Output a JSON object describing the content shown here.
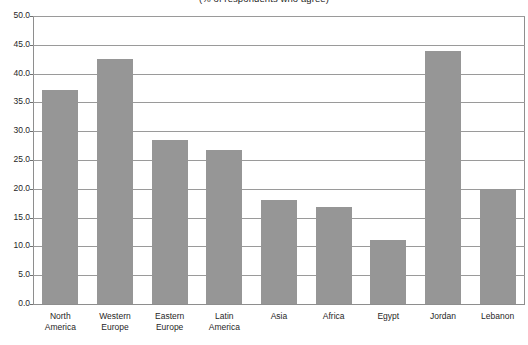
{
  "chart_data": {
    "type": "bar",
    "title": "(% of respondents who agree)",
    "xlabel": "",
    "ylabel": "",
    "categories": [
      "North America",
      "Western Europe",
      "Eastern Europe",
      "Latin America",
      "Asia",
      "Africa",
      "Egypt",
      "Jordan",
      "Lebanon"
    ],
    "category_lines": [
      [
        "North",
        "America"
      ],
      [
        "Western",
        "Europe"
      ],
      [
        "Eastern",
        "Europe"
      ],
      [
        "Latin",
        "America"
      ],
      [
        "Asia"
      ],
      [
        "Africa"
      ],
      [
        "Egypt"
      ],
      [
        "Jordan"
      ],
      [
        "Lebanon"
      ]
    ],
    "values": [
      37.2,
      42.5,
      28.5,
      26.7,
      18.0,
      16.8,
      11.2,
      44.0,
      20.0
    ],
    "ylim": [
      0.0,
      50.0
    ],
    "ytick_values": [
      0.0,
      5.0,
      10.0,
      15.0,
      20.0,
      25.0,
      30.0,
      35.0,
      40.0,
      45.0,
      50.0
    ],
    "ytick_labels": [
      "0.0",
      "5.0",
      "10.0",
      "15.0",
      "20.0",
      "25.0",
      "30.0",
      "35.0",
      "40.0",
      "45.0",
      "50.0"
    ],
    "grid": true,
    "legend": null,
    "bar_color": "#969696",
    "gridline_color": "#9a9a9a",
    "axis_color": "#8e8e8e",
    "background_color": "#ffffff"
  }
}
